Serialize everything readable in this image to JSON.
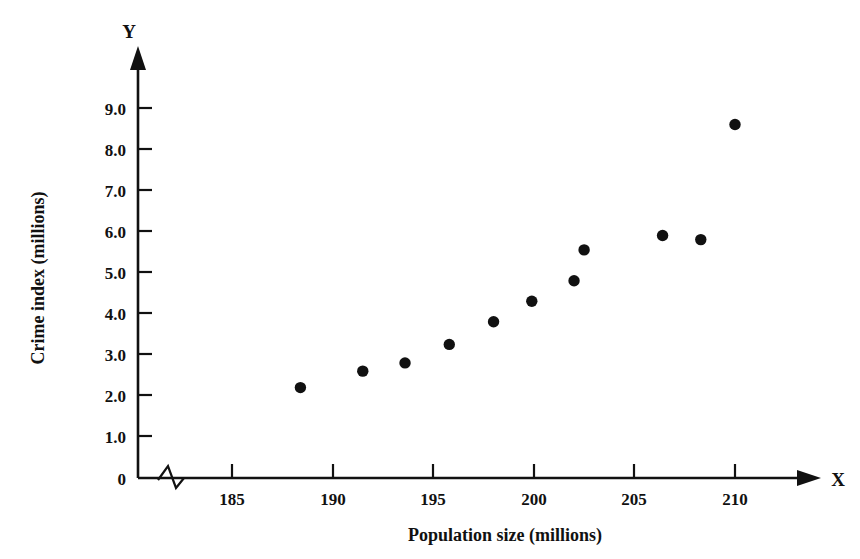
{
  "chart_data": {
    "type": "scatter",
    "title": "",
    "xlabel": "Population size (millions)",
    "ylabel": "Crime index (millions)",
    "x_axis_name": "X",
    "y_axis_name": "Y",
    "xlim": [
      181.5,
      213.5
    ],
    "ylim": [
      0,
      9.6
    ],
    "grid": false,
    "legend": false,
    "x_axis_break": true,
    "x_ticks": [
      185,
      190,
      195,
      200,
      205,
      210
    ],
    "x_tick_labels": [
      "185",
      "190",
      "195",
      "200",
      "205",
      "210"
    ],
    "y_ticks": [
      0,
      1.0,
      2.0,
      3.0,
      4.0,
      5.0,
      6.0,
      7.0,
      8.0,
      9.0
    ],
    "y_tick_labels": [
      "0",
      "1.0",
      "2.0",
      "3.0",
      "4.0",
      "5.0",
      "6.0",
      "7.0",
      "8.0",
      "9.0"
    ],
    "points": [
      {
        "x": 188.4,
        "y": 2.2
      },
      {
        "x": 191.5,
        "y": 2.6
      },
      {
        "x": 193.6,
        "y": 2.8
      },
      {
        "x": 195.8,
        "y": 3.25
      },
      {
        "x": 198.0,
        "y": 3.8
      },
      {
        "x": 199.9,
        "y": 4.3
      },
      {
        "x": 202.0,
        "y": 4.8
      },
      {
        "x": 202.5,
        "y": 5.55
      },
      {
        "x": 206.4,
        "y": 5.9
      },
      {
        "x": 208.3,
        "y": 5.8
      },
      {
        "x": 210.0,
        "y": 8.6
      }
    ],
    "marker": "filled-circle",
    "marker_color": "#111111",
    "marker_size": 9,
    "axis_color": "#111111",
    "background_color": "#ffffff"
  }
}
